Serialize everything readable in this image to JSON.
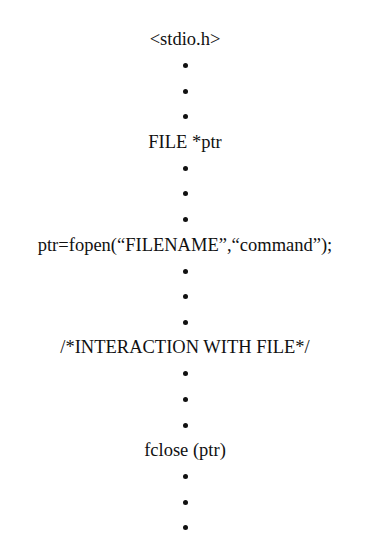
{
  "diagram": {
    "steps": [
      {
        "label": "<stdio.h>"
      },
      {
        "label": "FILE *ptr"
      },
      {
        "label": "ptr=fopen(“FILENAME”,“command”);"
      },
      {
        "label": "/*INTERACTION WITH FILE*/"
      },
      {
        "label": "fclose (ptr)"
      }
    ],
    "separator": "vertical ellipsis (3 dots)",
    "dots_between_steps": 3
  }
}
